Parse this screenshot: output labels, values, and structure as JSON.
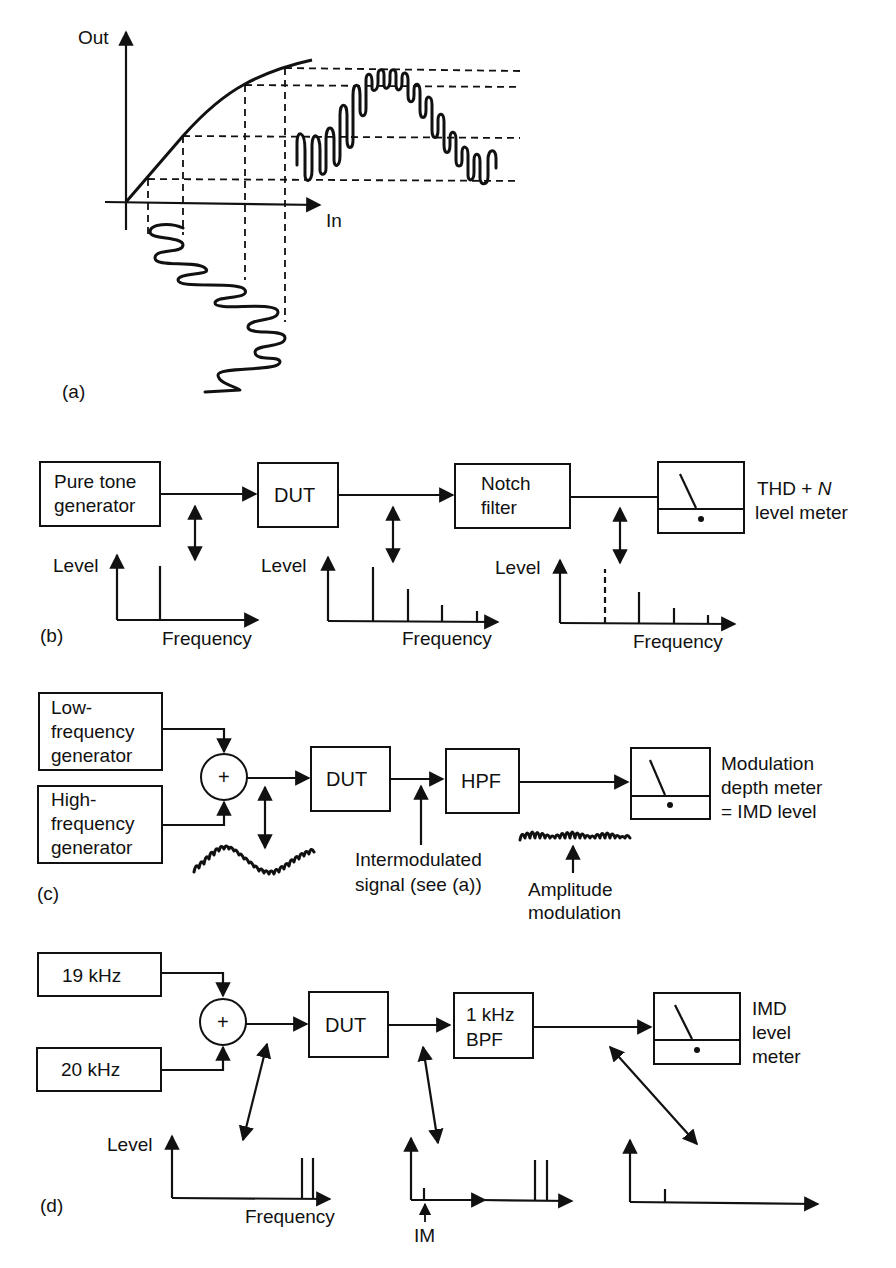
{
  "panel_a": {
    "label": "(a)",
    "y_axis": "Out",
    "x_axis": "In"
  },
  "panel_b": {
    "label": "(b)",
    "blocks": {
      "generator_line1": "Pure tone",
      "generator_line2": "generator",
      "dut": "DUT",
      "notch_line1": "Notch",
      "notch_line2": "filter"
    },
    "meter": {
      "line1_prefix": "THD + ",
      "line1_var": "N",
      "line2": "level meter"
    },
    "spectra": [
      {
        "ylabel": "Level",
        "xlabel": "Frequency",
        "lines": [
          {
            "height": 55,
            "style": "solid"
          }
        ]
      },
      {
        "ylabel": "Level",
        "xlabel": "Frequency",
        "lines": [
          {
            "height": 55,
            "style": "solid"
          },
          {
            "height": 32,
            "style": "solid"
          },
          {
            "height": 16,
            "style": "solid"
          },
          {
            "height": 8,
            "style": "solid"
          }
        ]
      },
      {
        "ylabel": "Level",
        "xlabel": "Frequency",
        "lines": [
          {
            "height": 55,
            "style": "dashed"
          },
          {
            "height": 32,
            "style": "solid"
          },
          {
            "height": 16,
            "style": "solid"
          },
          {
            "height": 8,
            "style": "solid"
          }
        ]
      }
    ]
  },
  "panel_c": {
    "label": "(c)",
    "blocks": {
      "low_gen_line1": "Low-",
      "low_gen_line2": "frequency",
      "low_gen_line3": "generator",
      "high_gen_line1": "High-",
      "high_gen_line2": "frequency",
      "high_gen_line3": "generator",
      "summer": "+",
      "dut": "DUT",
      "hpf": "HPF"
    },
    "meter": {
      "line1": "Modulation",
      "line2": "depth meter",
      "line3": "= IMD level"
    },
    "annotations": {
      "intermod_line1": "Intermodulated",
      "intermod_line2": "signal (see (a))",
      "am_line1": "Amplitude",
      "am_line2": "modulation"
    }
  },
  "panel_d": {
    "label": "(d)",
    "blocks": {
      "gen1": "19 kHz",
      "gen2": "20 kHz",
      "summer": "+",
      "dut": "DUT",
      "bpf_line1": "1 kHz",
      "bpf_line2": "BPF"
    },
    "meter": {
      "line1": "IMD",
      "line2": "level",
      "line3": "meter"
    },
    "spectra": [
      {
        "ylabel": "Level",
        "xlabel": "Frequency"
      },
      {
        "marker": "IM"
      },
      {}
    ]
  }
}
